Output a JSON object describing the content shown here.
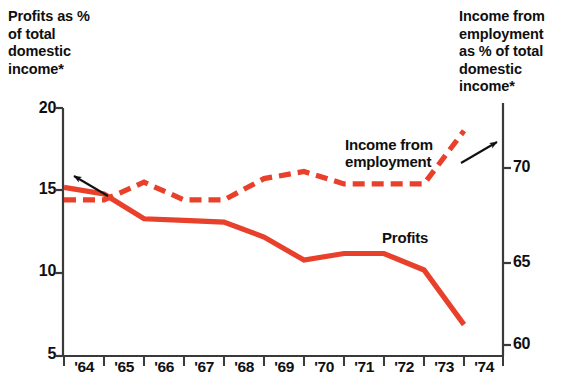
{
  "chart_data": {
    "type": "line",
    "title": "",
    "categories": [
      "'64",
      "'65",
      "'66",
      "'67",
      "'68",
      "'69",
      "'70",
      "'71",
      "'72",
      "'73",
      "'74"
    ],
    "x_tick_labels": [
      "'64",
      "'65",
      "'66",
      "'67",
      "'68",
      "'69",
      "'70",
      "'71",
      "'72",
      "'73",
      "'74"
    ],
    "grid": false,
    "legend": "inline-annotations",
    "axes": [
      {
        "id": "left",
        "position": "left",
        "label": "Profits as %\nof total\ndomestic\nincome*",
        "ticks": [
          20,
          15,
          10,
          5
        ],
        "tick_labels": [
          "20",
          "15",
          "10",
          "5"
        ],
        "ylim": [
          5,
          20
        ]
      },
      {
        "id": "right",
        "position": "right",
        "label": "Income from\nemployment\nas % of total\ndomestic\nincome*",
        "ticks": [
          70,
          65,
          60
        ],
        "tick_labels": [
          "70",
          "65",
          "60"
        ],
        "ylim": [
          58.5,
          73.6
        ]
      }
    ],
    "series": [
      {
        "name": "Profits",
        "axis": "left",
        "style": "solid",
        "color": "#E8402A",
        "annotation": "Profits",
        "values": [
          15.2,
          14.8,
          13.3,
          13.2,
          13.1,
          12.2,
          10.8,
          11.2,
          11.2,
          10.2,
          6.9
        ]
      },
      {
        "name": "Income from employment",
        "axis": "right",
        "style": "dashed",
        "color": "#E8402A",
        "annotation": "Income from\nemployment",
        "values": [
          68.2,
          68.2,
          69.2,
          68.2,
          68.2,
          69.4,
          69.8,
          69.1,
          69.1,
          69.1,
          72.1
        ]
      }
    ],
    "annotations": [
      {
        "name": "left-axis-arrow",
        "points_to": "Profits",
        "direction": "up-left"
      },
      {
        "name": "right-axis-arrow",
        "points_to": "Income from employment",
        "direction": "up-right"
      }
    ],
    "colors": {
      "series": "#E8402A",
      "axis": "#3a3a3a",
      "text": "#100f0f"
    }
  }
}
